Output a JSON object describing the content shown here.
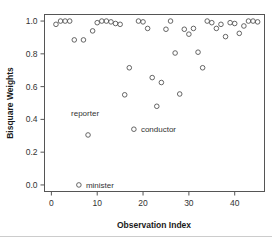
{
  "chart_data": {
    "type": "scatter",
    "title": "",
    "xlabel": "Observation Index",
    "ylabel": "Bisquare Weights",
    "xlim": [
      -1.5,
      46.5
    ],
    "ylim": [
      -0.04,
      1.04
    ],
    "xticks": [
      0,
      10,
      20,
      30,
      40
    ],
    "xticklabels": [
      "0",
      "10",
      "20",
      "30",
      "40"
    ],
    "yticks": [
      0.0,
      0.2,
      0.4,
      0.6,
      0.8,
      1.0
    ],
    "yticklabels": [
      "0.0",
      "0.2",
      "0.4",
      "0.6",
      "0.8",
      "1.0"
    ],
    "grid": false,
    "legend": false,
    "marker": "open-circle",
    "marker_color": "#555555",
    "x": [
      1,
      2,
      3,
      4,
      5,
      6,
      7,
      8,
      9,
      10,
      11,
      12,
      13,
      14,
      15,
      16,
      17,
      18,
      19,
      20,
      21,
      22,
      23,
      24,
      25,
      26,
      27,
      28,
      29,
      30,
      31,
      32,
      33,
      34,
      35,
      36,
      37,
      38,
      39,
      40,
      41,
      42,
      43,
      44,
      45
    ],
    "y": [
      0.98,
      1.0,
      1.0,
      1.0,
      0.885,
      0.0,
      0.885,
      0.305,
      0.94,
      0.99,
      1.0,
      1.0,
      0.995,
      0.985,
      0.98,
      0.55,
      0.715,
      0.34,
      1.0,
      0.995,
      0.955,
      0.655,
      0.48,
      0.625,
      0.95,
      1.0,
      0.805,
      0.555,
      0.95,
      0.92,
      0.955,
      0.81,
      0.715,
      1.0,
      0.99,
      0.955,
      0.98,
      0.905,
      0.99,
      0.985,
      0.925,
      0.97,
      1.0,
      1.0,
      0.995
    ],
    "annotations": [
      {
        "label": "minister",
        "x": 6,
        "y": 0.0,
        "dx": 7,
        "dy": 0
      },
      {
        "label": "reporter",
        "x": 8,
        "y": 0.305,
        "dx": -3,
        "dy": -22
      },
      {
        "label": "conductor",
        "x": 18,
        "y": 0.34,
        "dx": 7,
        "dy": 0
      }
    ]
  }
}
